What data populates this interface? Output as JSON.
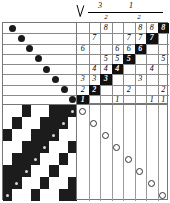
{
  "figure": {
    "header": {
      "arrow_icon": "down-arrow-icon",
      "fractions": [
        {
          "numerator": "3",
          "denominator": "2"
        },
        {
          "numerator": "1",
          "denominator": "2"
        }
      ]
    },
    "colors": {
      "ink": "#000000",
      "highlight_bg": "#111111",
      "highlight_fg": "#ffffff",
      "rule": "#8a8a8a",
      "dot_fill": "#1a1a1a",
      "dot_open": "#ffffff"
    }
  },
  "chart_data": {
    "type": "heatmap",
    "xlabel": "",
    "ylabel": "",
    "grid": true,
    "legend": "none",
    "rows": 8,
    "cols": 8,
    "matrix_values": [
      [
        "",
        "",
        "8",
        "",
        "",
        "8",
        "8",
        "8"
      ],
      [
        "",
        "7",
        "",
        "",
        "7",
        "7",
        "7",
        ""
      ],
      [
        "6",
        "",
        "",
        "6",
        "6",
        "6",
        "",
        ""
      ],
      [
        "",
        "",
        "5",
        "5",
        "5",
        "",
        "",
        "5"
      ],
      [
        "",
        "4",
        "4",
        "4",
        "",
        "",
        "4",
        ""
      ],
      [
        "3",
        "3",
        "3",
        "",
        "",
        "3",
        "",
        ""
      ],
      [
        "2",
        "2",
        "",
        "",
        "2",
        "",
        "",
        "2"
      ],
      [
        "1",
        "",
        "",
        "1",
        "",
        "",
        "1",
        "1"
      ]
    ],
    "highlighted_cells": [
      {
        "row": 0,
        "col": 7,
        "value": "8"
      },
      {
        "row": 1,
        "col": 6,
        "value": "7"
      },
      {
        "row": 2,
        "col": 5,
        "value": "6"
      },
      {
        "row": 3,
        "col": 4,
        "value": "5"
      },
      {
        "row": 4,
        "col": 3,
        "value": "4"
      },
      {
        "row": 5,
        "col": 2,
        "value": "3"
      },
      {
        "row": 6,
        "col": 1,
        "value": "2"
      },
      {
        "row": 7,
        "col": 0,
        "value": "1"
      }
    ],
    "filled_dots": [
      {
        "row": 0,
        "col": 0
      },
      {
        "row": 1,
        "col": 1
      },
      {
        "row": 2,
        "col": 2
      },
      {
        "row": 3,
        "col": 3
      },
      {
        "row": 4,
        "col": 4
      },
      {
        "row": 5,
        "col": 5
      },
      {
        "row": 6,
        "col": 6
      },
      {
        "row": 7,
        "col": 7
      }
    ],
    "open_dots": [
      {
        "row": 0,
        "col": 0
      },
      {
        "row": 1,
        "col": 1
      },
      {
        "row": 2,
        "col": 2
      },
      {
        "row": 3,
        "col": 3
      },
      {
        "row": 4,
        "col": 4
      },
      {
        "row": 5,
        "col": 5
      },
      {
        "row": 6,
        "col": 6
      },
      {
        "row": 7,
        "col": 7
      }
    ],
    "checkerboard": [
      [
        "w",
        "w",
        "b",
        "w",
        "w",
        "b",
        "b",
        "b"
      ],
      [
        "w",
        "b",
        "w",
        "w",
        "b",
        "b",
        "b",
        "w"
      ],
      [
        "b",
        "w",
        "w",
        "b",
        "b",
        "b",
        "w",
        "w"
      ],
      [
        "w",
        "w",
        "b",
        "b",
        "b",
        "w",
        "w",
        "b"
      ],
      [
        "w",
        "b",
        "b",
        "b",
        "w",
        "w",
        "b",
        "w"
      ],
      [
        "b",
        "b",
        "b",
        "w",
        "w",
        "b",
        "w",
        "w"
      ],
      [
        "b",
        "b",
        "w",
        "w",
        "b",
        "w",
        "w",
        "b"
      ],
      [
        "b",
        "w",
        "w",
        "b",
        "w",
        "w",
        "b",
        "b"
      ]
    ],
    "checkerboard_dots": [
      {
        "row": 0,
        "col": 7
      },
      {
        "row": 1,
        "col": 6
      },
      {
        "row": 2,
        "col": 5
      },
      {
        "row": 3,
        "col": 4
      },
      {
        "row": 4,
        "col": 3
      },
      {
        "row": 5,
        "col": 2
      },
      {
        "row": 6,
        "col": 1
      },
      {
        "row": 7,
        "col": 0
      }
    ]
  }
}
